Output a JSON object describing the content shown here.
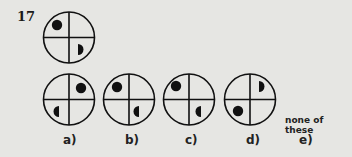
{
  "question": {
    "number": "17",
    "stem": {
      "name": "question-figure",
      "dot_quadrant": "top-left",
      "half_dot_quadrant": "bottom-right"
    }
  },
  "options": [
    {
      "label": "a)",
      "dot_quadrant": "top-right",
      "half_dot_quadrant": "bottom-left"
    },
    {
      "label": "b)",
      "dot_quadrant": "top-left",
      "half_dot_quadrant": "bottom-right"
    },
    {
      "label": "c)",
      "dot_quadrant": "top-left",
      "half_dot_quadrant": "bottom-right"
    },
    {
      "label": "d)",
      "dot_quadrant": "bottom-left",
      "half_dot_quadrant": "top-right"
    },
    {
      "label": "e)",
      "text": "none of these"
    }
  ],
  "colors": {
    "background": "#e6e6e3",
    "ink": "#111111"
  }
}
